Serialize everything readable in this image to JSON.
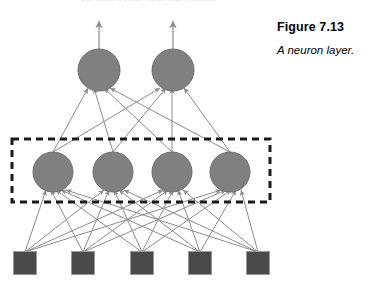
{
  "figure": {
    "title": "Figure 7.13",
    "caption": "A neuron layer.",
    "top_partial_text": "be sent to the next layer along",
    "colors": {
      "neuron_fill": "#808080",
      "neuron_stroke": "#6e6e6e",
      "input_fill": "#4a4a4a",
      "input_stroke": "#9a9a9a",
      "connection": "#8c8c8c",
      "dashed_box": "#1a1a1a",
      "background": "#ffffff"
    }
  },
  "diagram_data": {
    "type": "neural-network-layer-diagram",
    "description": "A fully connected feed-forward neuron layer diagram with five inputs, four highlighted neurons in a dashed box, and two output neurons with outgoing arrows.",
    "layers": [
      {
        "id": "output",
        "name": "output-neurons",
        "shape": "circle",
        "count": 2,
        "radius": 21,
        "y": 70,
        "x_positions": [
          99,
          173
        ],
        "labels": [
          "",
          ""
        ],
        "has_outgoing_arrow": true
      },
      {
        "id": "hidden",
        "name": "neuron-layer",
        "shape": "circle",
        "count": 4,
        "radius": 20,
        "y": 172,
        "x_positions": [
          53,
          113,
          172,
          230
        ],
        "labels": [
          "",
          "",
          "",
          ""
        ],
        "highlighted": true
      },
      {
        "id": "input",
        "name": "input-nodes",
        "shape": "square",
        "count": 5,
        "size": 23,
        "y": 263,
        "x_positions": [
          25,
          83,
          142,
          200,
          258
        ],
        "labels": [
          "",
          "",
          "",
          "",
          ""
        ]
      }
    ],
    "highlight_box": {
      "name": "layer-highlight-box",
      "x": 12,
      "y": 139,
      "width": 258,
      "height": 63,
      "style": "dashed",
      "stroke_width": 3,
      "dash": "7 5"
    },
    "connections": {
      "input_to_hidden": "fully-connected",
      "hidden_to_output": "fully-connected",
      "arrowheads": true,
      "direction": "upward"
    },
    "output_arrows": {
      "count": 2,
      "from_y": 49,
      "to_y": 20,
      "x_positions": [
        99,
        173
      ]
    }
  }
}
